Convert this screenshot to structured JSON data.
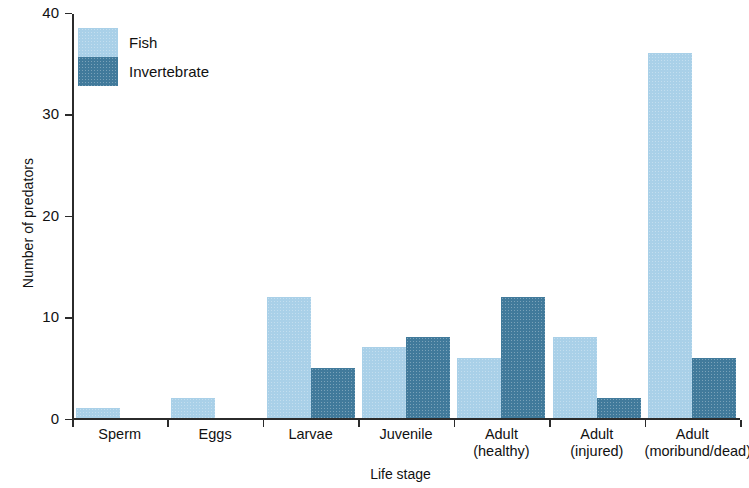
{
  "chart_data": {
    "type": "bar",
    "title": "",
    "subtitle": "",
    "xlabel": "Life stage",
    "ylabel": "Number of predators",
    "categories": [
      "Sperm",
      "Eggs",
      "Larvae",
      "Juvenile",
      "Adult (healthy)",
      "Adult (injured)",
      "Adult (moribund/dead)"
    ],
    "category_lines": [
      [
        "Sperm",
        ""
      ],
      [
        "Eggs",
        ""
      ],
      [
        "Larvae",
        ""
      ],
      [
        "Juvenile",
        ""
      ],
      [
        "Adult",
        "(healthy)"
      ],
      [
        "Adult",
        "(injured)"
      ],
      [
        "Adult",
        "(moribund/dead)"
      ]
    ],
    "series": [
      {
        "name": "Fish",
        "color": "#a9d0e8",
        "values": [
          1,
          2,
          12,
          7,
          6,
          8,
          36
        ]
      },
      {
        "name": "Invertebrate",
        "color": "#417a9b",
        "values": [
          0,
          0,
          5,
          8,
          12,
          2,
          6
        ]
      }
    ],
    "ylim": [
      0,
      40
    ],
    "yticks": [
      0,
      10,
      20,
      30,
      40
    ],
    "ytick_labels": [
      "0",
      "10",
      "20",
      "30",
      "40"
    ],
    "grid": false,
    "legend_position": "top-left",
    "legend": [
      "Fish",
      "Invertebrate"
    ]
  },
  "colors": {
    "fish": "#a9d0e8",
    "invertebrate": "#417a9b",
    "axis": "#2b2b2b",
    "text": "#111111",
    "background": "#ffffff"
  }
}
